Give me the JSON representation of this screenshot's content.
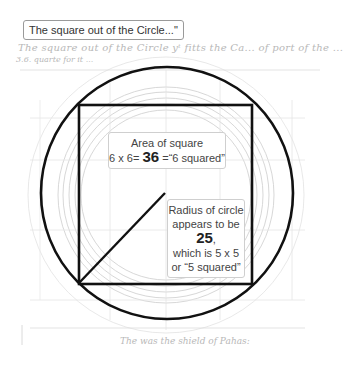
{
  "title": "The square out of the Circle...\"",
  "handwriting": {
    "line1": "The square out of the Circle yᵗ fitts the Ca... of port of the ...",
    "line2": "3.6. quarte for it ...",
    "footer": "The was the shield of Pahas:"
  },
  "area_label": {
    "line1": "Area of square",
    "line2_prefix": "6 x 6=",
    "value": "36",
    "line2_suffix": "=“6 squared”"
  },
  "radius_label": {
    "line1": "Radius of circle",
    "line2": "appears to be",
    "value": "25",
    "value_suffix": ",",
    "line3": "which is 5 x 5",
    "line4": "or “5 squared”"
  },
  "colors": {
    "shape_stroke": "#111111",
    "sketch_lines": "#c8c8c8",
    "label_border": "#cfcfcf"
  }
}
